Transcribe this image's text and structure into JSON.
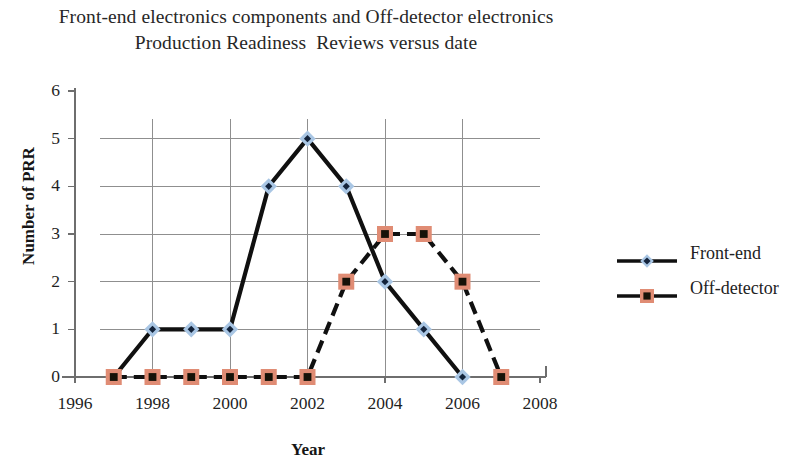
{
  "chart_data": {
    "type": "line",
    "title": "Front-end electronics components and Off-detector electronics Production Readiness  Reviews versus date",
    "title_lines": [
      "Front-end electronics components and Off-detector electronics",
      "Production Readiness  Reviews versus date"
    ],
    "xlabel": "Year",
    "ylabel": "Number of PRR",
    "xlim": [
      1996,
      2008
    ],
    "ylim": [
      0,
      6
    ],
    "x_ticks": [
      "1996",
      "1998",
      "2000",
      "2002",
      "2004",
      "2006",
      "2008"
    ],
    "x_tick_values": [
      1996,
      1998,
      2000,
      2002,
      2004,
      2006,
      2008
    ],
    "y_ticks": [
      "0",
      "1",
      "2",
      "3",
      "4",
      "5",
      "6"
    ],
    "y_tick_values": [
      0,
      1,
      2,
      3,
      4,
      5,
      6
    ],
    "grid": "horizontal-and-vertical",
    "legend_position": "right",
    "series": [
      {
        "name": "Front-end",
        "marker": "diamond",
        "marker_color": "#A9C6E4",
        "marker_core_color": "#13233B",
        "line_color": "#101010",
        "line_style": "solid",
        "x": [
          1997,
          1998,
          1999,
          2000,
          2001,
          2002,
          2003,
          2004,
          2005,
          2006
        ],
        "values": [
          0,
          1,
          1,
          1,
          4,
          5,
          4,
          2,
          1,
          0
        ]
      },
      {
        "name": "Off-detector",
        "marker": "square",
        "marker_color": "#E08C74",
        "marker_core_color": "#161208",
        "line_color": "#101010",
        "line_style": "dashed",
        "x": [
          1997,
          1998,
          1999,
          2000,
          2001,
          2002,
          2003,
          2004,
          2005,
          2006,
          2007
        ],
        "values": [
          0,
          0,
          0,
          0,
          0,
          0,
          2,
          3,
          3,
          2,
          0
        ]
      }
    ]
  },
  "legend": {
    "items": [
      {
        "label": "Front-end"
      },
      {
        "label": "Off-detector"
      }
    ]
  },
  "colors": {
    "front_end_marker": "#A9C6E4",
    "off_detector_marker": "#E08C74",
    "line": "#101010",
    "grid": "#8f8f8f",
    "axis": "#6e6e6e",
    "text": "#1f1f1f"
  }
}
